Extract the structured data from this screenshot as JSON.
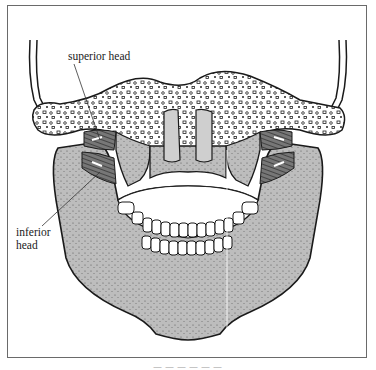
{
  "figure": {
    "labels": {
      "superior": "superior head",
      "inferior_line1": "inferior",
      "inferior_line2": "head"
    },
    "caption": "— — — — — —"
  },
  "colors": {
    "frame": "#6a6a6a",
    "bone_fill": "#bdbdbd",
    "bone_dark": "#8a8a8a",
    "outline": "#1a1a1a",
    "skull_base": "#ffffff",
    "muscle": "#5a5a5a",
    "teeth": "#ffffff"
  }
}
